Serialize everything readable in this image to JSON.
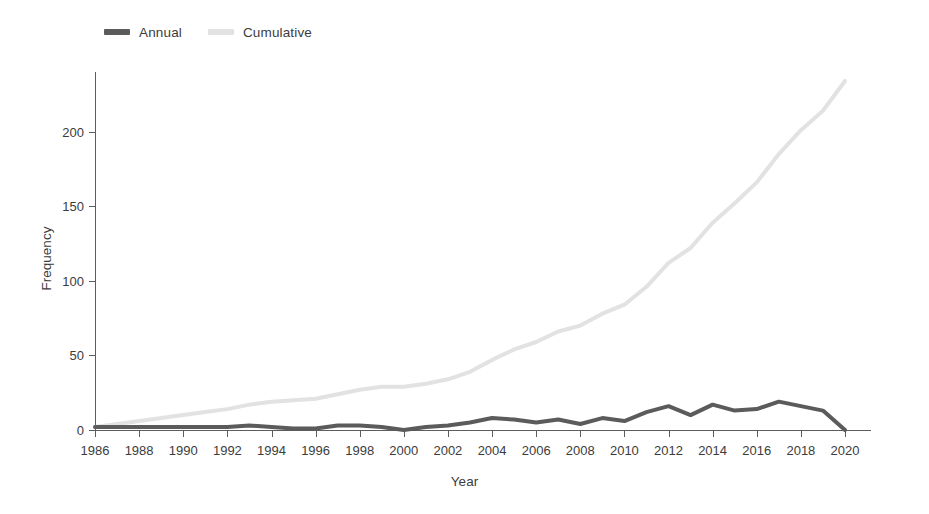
{
  "figure": {
    "background": "#ffffff"
  },
  "legend": {
    "position": "top-left",
    "entries": [
      {
        "label": "Annual",
        "color": "#5b5b5b",
        "icon": "line-swatch-icon"
      },
      {
        "label": "Cumulative",
        "color": "#e2e2e2",
        "icon": "line-swatch-icon"
      }
    ]
  },
  "chart_data": {
    "type": "line",
    "title": "",
    "subtitle": "",
    "xlabel": "Year",
    "ylabel": "Frequency",
    "xlim": [
      1986,
      2020
    ],
    "ylim": [
      0,
      240
    ],
    "grid": false,
    "legend_position": "top-left",
    "x_tick_labels": [
      "1986",
      "1988",
      "1990",
      "1992",
      "1994",
      "1996",
      "1998",
      "2000",
      "2002",
      "2004",
      "2006",
      "2008",
      "2010",
      "2012",
      "2014",
      "2016",
      "2018",
      "2020"
    ],
    "x_tick_values": [
      1986,
      1988,
      1990,
      1992,
      1994,
      1996,
      1998,
      2000,
      2002,
      2004,
      2006,
      2008,
      2010,
      2012,
      2014,
      2016,
      2018,
      2020
    ],
    "y_tick_labels": [
      "0",
      "50",
      "100",
      "150",
      "200"
    ],
    "y_tick_values": [
      0,
      50,
      100,
      150,
      200
    ],
    "x": [
      1986,
      1987,
      1988,
      1989,
      1990,
      1991,
      1992,
      1993,
      1994,
      1995,
      1996,
      1997,
      1998,
      1999,
      2000,
      2001,
      2002,
      2003,
      2004,
      2005,
      2006,
      2007,
      2008,
      2009,
      2010,
      2011,
      2012,
      2013,
      2014,
      2015,
      2016,
      2017,
      2018,
      2019,
      2020
    ],
    "series": [
      {
        "name": "Annual",
        "color": "#5b5b5b",
        "width": 4,
        "values": [
          2,
          2,
          2,
          2,
          2,
          2,
          2,
          3,
          2,
          1,
          1,
          3,
          3,
          2,
          0,
          2,
          3,
          5,
          8,
          7,
          5,
          7,
          4,
          8,
          6,
          12,
          16,
          10,
          17,
          13,
          14,
          19,
          16,
          13,
          0
        ]
      },
      {
        "name": "Cumulative",
        "color": "#e2e2e2",
        "width": 4,
        "values": [
          2,
          4,
          6,
          8,
          10,
          12,
          14,
          17,
          19,
          20,
          21,
          24,
          27,
          29,
          29,
          31,
          34,
          39,
          47,
          54,
          59,
          66,
          70,
          78,
          84,
          96,
          112,
          122,
          139,
          152,
          166,
          185,
          201,
          214,
          234
        ]
      }
    ]
  }
}
